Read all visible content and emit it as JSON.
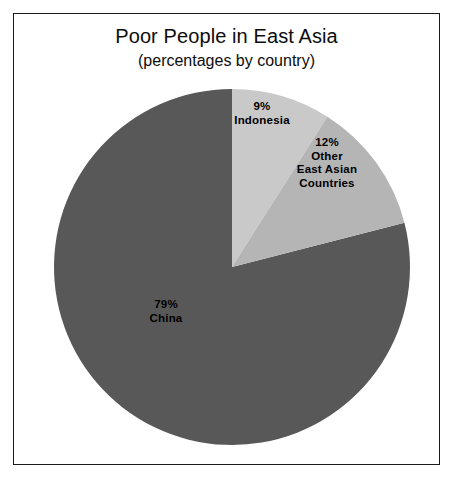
{
  "figure": {
    "background_color": "#ffffff",
    "frame_color": "#1a1a1a"
  },
  "chart_data": {
    "type": "pie",
    "title": "Poor People in East Asia",
    "subtitle": "(percentages by country)",
    "xlabel": "",
    "ylabel": "",
    "units": "percent",
    "total": 100,
    "start_angle_deg": 0,
    "direction": "clockwise",
    "legend": "none (labels drawn inside slices)",
    "grid": false,
    "categories": [
      "Indonesia",
      "Other East Asian Countries",
      "China"
    ],
    "values": [
      9,
      12,
      79
    ],
    "colors": [
      "#c9c9c9",
      "#b5b5b5",
      "#585858"
    ],
    "slices": [
      {
        "name": "Indonesia",
        "value": 9,
        "percent_label": "9%",
        "label_lines": [
          "9%",
          "Indonesia"
        ],
        "color": "#c9c9c9",
        "start_angle_deg": 0,
        "end_angle_deg": 32.4
      },
      {
        "name": "Other East Asian Countries",
        "value": 12,
        "percent_label": "12%",
        "label_lines": [
          "12%",
          "Other",
          "East Asian",
          "Countries"
        ],
        "color": "#b5b5b5",
        "start_angle_deg": 32.4,
        "end_angle_deg": 75.6
      },
      {
        "name": "China",
        "value": 79,
        "percent_label": "79%",
        "label_lines": [
          "79%",
          "China"
        ],
        "color": "#585858",
        "start_angle_deg": 75.6,
        "end_angle_deg": 360
      }
    ]
  },
  "labels": {
    "indonesia": {
      "line1": "9%",
      "line2": "Indonesia"
    },
    "other": {
      "line1": "12%",
      "line2": "Other",
      "line3": "East Asian",
      "line4": "Countries"
    },
    "china": {
      "line1": "79%",
      "line2": "China"
    }
  }
}
